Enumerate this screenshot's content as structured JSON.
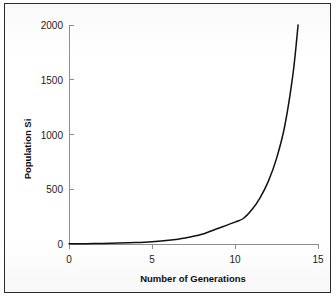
{
  "chart_data": {
    "type": "line",
    "title": "",
    "xlabel": "Number of Generations",
    "ylabel": "Population Si",
    "xlim": [
      0,
      15
    ],
    "ylim": [
      0,
      2000
    ],
    "xticks": [
      "0",
      "5",
      "10",
      "15"
    ],
    "xtick_values": [
      0,
      5,
      10,
      15
    ],
    "yticks": [
      "0",
      "500",
      "1000",
      "1500",
      "2000"
    ],
    "ytick_values": [
      0,
      500,
      1000,
      1500,
      2000
    ],
    "grid": false,
    "legend": false,
    "series": [
      {
        "name": "Population growth",
        "x": [
          0,
          1,
          2,
          3,
          4,
          5,
          6,
          7,
          8,
          9,
          10,
          10.5,
          11,
          11.5,
          12,
          12.5,
          13,
          13.5,
          13.8
        ],
        "values": [
          2,
          3,
          5,
          8,
          13,
          21,
          34,
          55,
          89,
          144,
          200,
          233,
          310,
          420,
          570,
          780,
          1080,
          1560,
          2000
        ]
      }
    ],
    "annotations": [],
    "line_color": "#111111",
    "axis_color": "#8e8e8e"
  },
  "figure": {
    "frame_visible": true,
    "background_color": "#ffffff"
  },
  "axis_labels": {
    "y_title": "Population Si",
    "x_title": "Number of Generations"
  }
}
